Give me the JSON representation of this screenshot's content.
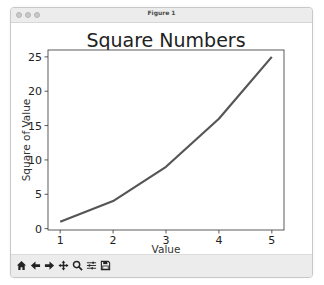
{
  "window": {
    "title": "Figure 1",
    "traffic_lights": [
      "close",
      "minimize",
      "zoom"
    ]
  },
  "toolbar": {
    "buttons": [
      {
        "name": "home",
        "icon": "home-icon"
      },
      {
        "name": "back",
        "icon": "arrow-left-icon"
      },
      {
        "name": "forward",
        "icon": "arrow-right-icon"
      },
      {
        "name": "pan",
        "icon": "move-icon"
      },
      {
        "name": "zoom",
        "icon": "magnifier-icon"
      },
      {
        "name": "configure-subplots",
        "icon": "sliders-icon"
      },
      {
        "name": "save",
        "icon": "floppy-disk-icon"
      }
    ]
  },
  "chart_data": {
    "type": "line",
    "title": "Square Numbers",
    "xlabel": "Value",
    "ylabel": "Square of Value",
    "x": [
      1,
      2,
      3,
      4,
      5
    ],
    "series": [
      {
        "name": "squares",
        "values": [
          1,
          4,
          9,
          16,
          25
        ],
        "color": "#555555"
      }
    ],
    "xticks": [
      1,
      2,
      3,
      4,
      5
    ],
    "yticks": [
      0,
      5,
      10,
      15,
      20,
      25
    ],
    "xlim": [
      0.77,
      5.23
    ],
    "ylim": [
      -0.2,
      26.0
    ],
    "grid": false,
    "legend": null
  }
}
